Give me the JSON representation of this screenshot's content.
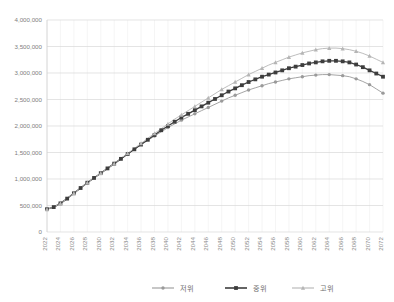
{
  "chart_data": {
    "type": "line",
    "title": "",
    "subtitle": "",
    "xlabel": "",
    "ylabel": "",
    "ylim": [
      0,
      4000000
    ],
    "xlim": [
      2022,
      2072
    ],
    "grid": true,
    "legend_position": "bottom",
    "y_ticks": [
      "0",
      "500,000",
      "1,000,000",
      "1,500,000",
      "2,000,000",
      "2,500,000",
      "3,000,000",
      "3,500,000",
      "4,000,000"
    ],
    "y_tick_values": [
      0,
      500000,
      1000000,
      1500000,
      2000000,
      2500000,
      3000000,
      3500000,
      4000000
    ],
    "x_tick_labels": [
      "2022",
      "2024",
      "2026",
      "2028",
      "2030",
      "2032",
      "2034",
      "2036",
      "2038",
      "2040",
      "2042",
      "2044",
      "2046",
      "2048",
      "2050",
      "2052",
      "2054",
      "2056",
      "2058",
      "2060",
      "2062",
      "2064",
      "2066",
      "2068",
      "2070",
      "2072"
    ],
    "x": [
      2022,
      2023,
      2024,
      2025,
      2026,
      2027,
      2028,
      2029,
      2030,
      2031,
      2032,
      2033,
      2034,
      2035,
      2036,
      2037,
      2038,
      2039,
      2040,
      2041,
      2042,
      2043,
      2044,
      2045,
      2046,
      2047,
      2048,
      2049,
      2050,
      2051,
      2052,
      2053,
      2054,
      2055,
      2056,
      2057,
      2058,
      2059,
      2060,
      2061,
      2062,
      2063,
      2064,
      2065,
      2066,
      2067,
      2068,
      2069,
      2070,
      2071,
      2072
    ],
    "series": [
      {
        "name": "저위",
        "marker": "circle",
        "color": "#9a9a9a",
        "values": [
          430000,
          470000,
          540000,
          630000,
          730000,
          830000,
          930000,
          1020000,
          1110000,
          1200000,
          1290000,
          1380000,
          1470000,
          1560000,
          1650000,
          1730000,
          1810000,
          1890000,
          1970000,
          2040000,
          2110000,
          2170000,
          2230000,
          2290000,
          2350000,
          2410000,
          2470000,
          2530000,
          2580000,
          2630000,
          2680000,
          2720000,
          2760000,
          2800000,
          2830000,
          2860000,
          2890000,
          2910000,
          2930000,
          2950000,
          2960000,
          2970000,
          2970000,
          2960000,
          2950000,
          2930000,
          2890000,
          2840000,
          2780000,
          2700000,
          2620000
        ]
      },
      {
        "name": "중위",
        "marker": "square",
        "color": "#3d3d3d",
        "values": [
          430000,
          470000,
          540000,
          630000,
          730000,
          830000,
          930000,
          1020000,
          1110000,
          1200000,
          1290000,
          1380000,
          1470000,
          1560000,
          1650000,
          1740000,
          1830000,
          1920000,
          2000000,
          2080000,
          2160000,
          2230000,
          2300000,
          2370000,
          2440000,
          2510000,
          2580000,
          2650000,
          2710000,
          2770000,
          2830000,
          2880000,
          2930000,
          2970000,
          3010000,
          3050000,
          3090000,
          3120000,
          3150000,
          3180000,
          3200000,
          3220000,
          3230000,
          3230000,
          3220000,
          3200000,
          3160000,
          3110000,
          3050000,
          2990000,
          2930000
        ]
      },
      {
        "name": "고위",
        "marker": "triangle",
        "color": "#b5b5b5",
        "values": [
          430000,
          470000,
          540000,
          630000,
          730000,
          830000,
          930000,
          1020000,
          1110000,
          1200000,
          1290000,
          1390000,
          1480000,
          1580000,
          1670000,
          1770000,
          1860000,
          1950000,
          2040000,
          2130000,
          2210000,
          2290000,
          2370000,
          2450000,
          2530000,
          2610000,
          2690000,
          2760000,
          2830000,
          2900000,
          2970000,
          3030000,
          3090000,
          3150000,
          3200000,
          3250000,
          3300000,
          3340000,
          3380000,
          3410000,
          3440000,
          3460000,
          3470000,
          3470000,
          3460000,
          3440000,
          3410000,
          3370000,
          3320000,
          3260000,
          3200000
        ]
      }
    ]
  },
  "legend": {
    "items": [
      {
        "label": "저위"
      },
      {
        "label": "중위"
      },
      {
        "label": "고위"
      }
    ]
  }
}
